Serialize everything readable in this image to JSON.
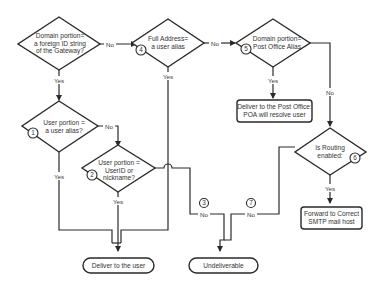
{
  "diagram": {
    "type": "flowchart",
    "decisions": [
      {
        "id": "d0",
        "lines": [
          "Domain portion=",
          "a foreign ID string",
          "of the Gateway?"
        ],
        "number": ""
      },
      {
        "id": "d4",
        "lines": [
          "Full Address=",
          "a user alias"
        ],
        "number": "4"
      },
      {
        "id": "d5",
        "lines": [
          "Domain portion=",
          "Post Office Alias"
        ],
        "number": "5"
      },
      {
        "id": "d1",
        "lines": [
          "User portion =",
          "a user alias?"
        ],
        "number": "1"
      },
      {
        "id": "d2",
        "lines": [
          "User portion =",
          "UserID or",
          "nickname?"
        ],
        "number": "2"
      },
      {
        "id": "d6",
        "lines": [
          "Is Routing",
          "enabled:"
        ],
        "number": "6"
      }
    ],
    "processes": [
      {
        "id": "p_postoffice",
        "lines": [
          "Deliver to the Post Office:",
          "POA will resolve user"
        ]
      },
      {
        "id": "p_forward",
        "lines": [
          "Forward to Correct",
          "SMTP mail host"
        ]
      }
    ],
    "terminals": [
      {
        "id": "t_user",
        "label": "Deliver to the user"
      },
      {
        "id": "t_undeliverable",
        "label": "Undeliverable"
      }
    ],
    "edge_labels": {
      "yes": "Yes",
      "no": "No"
    },
    "connector_numbers": {
      "n3": "3",
      "n7": "7"
    },
    "edges": [
      {
        "from": "d0",
        "to": "d4",
        "label": "No"
      },
      {
        "from": "d0",
        "to": "d1",
        "label": "Yes"
      },
      {
        "from": "d4",
        "to": "d5",
        "label": "No"
      },
      {
        "from": "d4",
        "to": "t_user",
        "label": "Yes"
      },
      {
        "from": "d5",
        "to": "p_postoffice",
        "label": "Yes"
      },
      {
        "from": "d5",
        "to": "d6",
        "label": "No"
      },
      {
        "from": "d1",
        "to": "d2",
        "label": "No"
      },
      {
        "from": "d1",
        "to": "t_user",
        "label": "Yes"
      },
      {
        "from": "d2",
        "to": "t_user",
        "label": "Yes"
      },
      {
        "from": "d2",
        "to": "t_undeliverable",
        "label": "No",
        "number": "3"
      },
      {
        "from": "d6",
        "to": "t_undeliverable",
        "label": "No",
        "number": "7"
      },
      {
        "from": "d6",
        "to": "p_forward",
        "label": "Yes"
      }
    ],
    "colors": {
      "stroke": "#2a2a2a",
      "fill": "#ffffff",
      "text": "#333333"
    }
  }
}
